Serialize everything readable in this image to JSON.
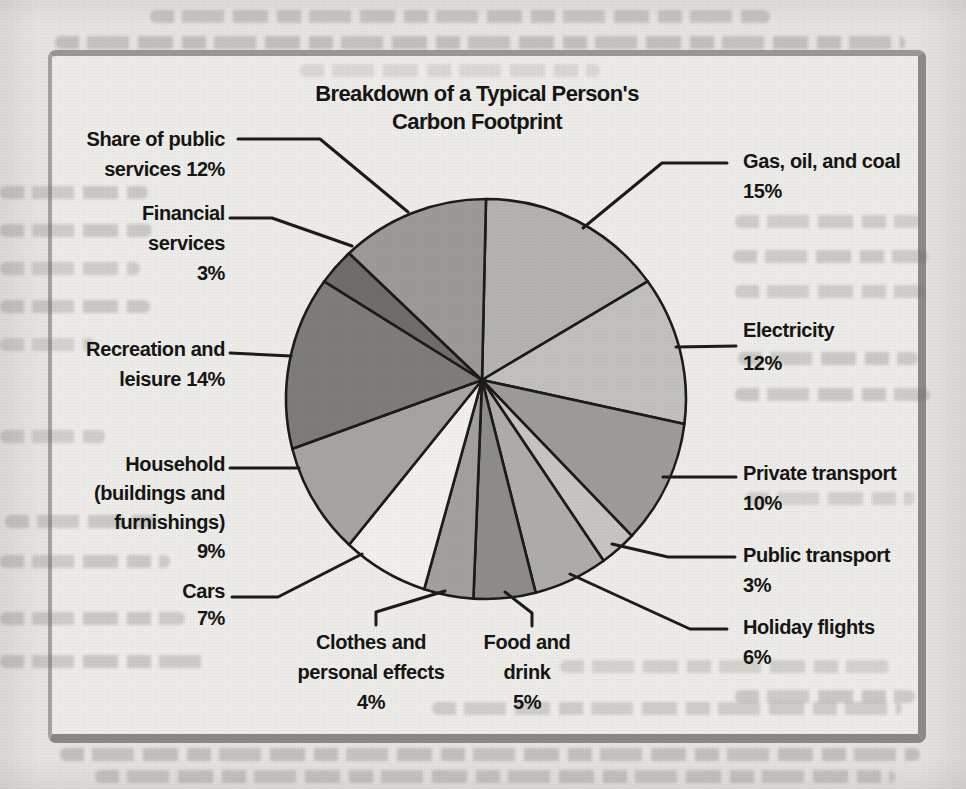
{
  "palette": {
    "paper": "#e5e3df",
    "box_fill": "#edebe7",
    "frame_border": "#908e8b",
    "ink": "#151513"
  },
  "chart_data": {
    "type": "pie",
    "title": "Breakdown of a Typical Person's Carbon Footprint",
    "title_lines": [
      "Breakdown of a Typical Person's",
      "Carbon Footprint"
    ],
    "start_angle_deg": 0,
    "direction": "clockwise",
    "legend_position": "callout-labels",
    "units": "%",
    "segments": [
      {
        "id": "gas-oil-coal",
        "label": "Gas, oil, and coal",
        "value": 15,
        "color": "#b4b2af"
      },
      {
        "id": "electricity",
        "label": "Electricity",
        "value": 12,
        "color": "#c2c0bc"
      },
      {
        "id": "private-transport",
        "label": "Private transport",
        "value": 10,
        "color": "#9d9b98"
      },
      {
        "id": "public-transport",
        "label": "Public transport",
        "value": 3,
        "color": "#c6c4c0"
      },
      {
        "id": "holiday-flights",
        "label": "Holiday flights",
        "value": 6,
        "color": "#aeaca8"
      },
      {
        "id": "food-drink",
        "label": "Food and drink",
        "value": 5,
        "color": "#8e8c89"
      },
      {
        "id": "clothes-personal-effects",
        "label": "Clothes and personal effects",
        "value": 4,
        "color": "#a2a09d"
      },
      {
        "id": "cars",
        "label": "Cars",
        "value": 7,
        "color": "#f0efeb"
      },
      {
        "id": "household",
        "label": "Household (buildings and furnishings)",
        "value": 9,
        "color": "#a6a4a1"
      },
      {
        "id": "recreation-leisure",
        "label": "Recreation and leisure",
        "value": 14,
        "color": "#7e7c79"
      },
      {
        "id": "financial-services",
        "label": "Financial services",
        "value": 3,
        "color": "#6f6d6a"
      },
      {
        "id": "share-public-services",
        "label": "Share of public services",
        "value": 12,
        "color": "#9c9a97"
      }
    ]
  },
  "callouts": {
    "gas": {
      "lines": [
        "Gas, oil, and coal",
        "15%"
      ]
    },
    "electricity": {
      "lines": [
        "Electricity",
        "12%"
      ]
    },
    "private_transport": {
      "lines": [
        "Private transport",
        "10%"
      ]
    },
    "public_transport": {
      "lines": [
        "Public transport",
        "3%"
      ]
    },
    "holiday_flights": {
      "lines": [
        "Holiday flights",
        "6%"
      ]
    },
    "food_drink": {
      "lines": [
        "Food and",
        "drink",
        "5%"
      ]
    },
    "clothes": {
      "lines": [
        "Clothes and",
        "personal effects",
        "4%"
      ]
    },
    "cars": {
      "lines": [
        "Cars",
        "7%"
      ]
    },
    "household": {
      "lines": [
        "Household",
        "(buildings and",
        "furnishings)",
        "9%"
      ]
    },
    "recreation": {
      "lines": [
        "Recreation and",
        "leisure 14%"
      ]
    },
    "financial": {
      "lines": [
        "Financial",
        "services",
        "3%"
      ]
    },
    "public_services": {
      "lines": [
        "Share of public",
        "services 12%"
      ]
    }
  }
}
